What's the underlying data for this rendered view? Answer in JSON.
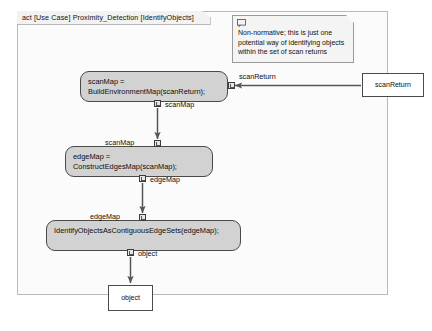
{
  "frame": {
    "title": "act [Use Case] Proximity_Detection [IdentifyObjects]"
  },
  "note": {
    "icon": "note-comment-icon",
    "text": "Non-normative; this is just one\npotential way of identifying objects\nwithin the set of scan returns"
  },
  "actions": [
    {
      "id": "action-1",
      "text": "scanMap =\nBuildEnvironmentMap(scanReturn);",
      "input_pin_label": "scanReturn",
      "output_pin_label": "scanMap"
    },
    {
      "id": "action-2",
      "text": "edgeMap =\nConstructEdgesMap(scanMap);",
      "input_pin_label": "scanMap",
      "output_pin_label": "edgeMap"
    },
    {
      "id": "action-3",
      "text": "IdentifyObjectsAsContiguousEdgeSets(edgeMap);",
      "input_pin_label": "edgeMap",
      "output_pin_label": "object"
    }
  ],
  "object_nodes": [
    {
      "id": "obj-scanreturn",
      "label": "scanReturn"
    },
    {
      "id": "obj-object",
      "label": "object"
    }
  ],
  "edge_labels": {
    "scanreturn_in": "scanReturn",
    "scanmap_out": "scanMap",
    "scanmap_in": "scanMap",
    "edgemap_out": "edgeMap",
    "edgemap_in": "edgeMap",
    "object_out": "object"
  },
  "colors": {
    "action_fill": "#d2d2d2",
    "action_stroke": "#4a4a4a",
    "frame_stroke": "#b9b9b9",
    "frame_fill": "#fbfbfb",
    "note_fill": "#f4f4f4",
    "note_stroke": "#9a9a9a",
    "flow_stroke": "#555555",
    "object_fill": "#ffffff"
  }
}
